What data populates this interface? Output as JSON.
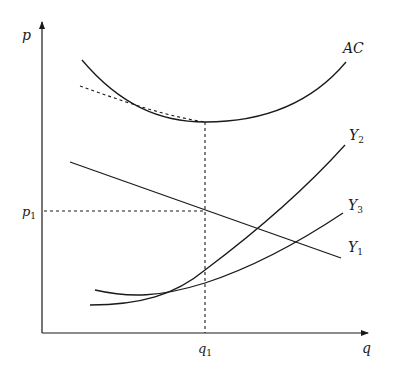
{
  "diagram": {
    "type": "economics-cost-curves",
    "axes": {
      "y_label": "p",
      "x_label": "q"
    },
    "reference_points": {
      "p1": {
        "label": "p",
        "subscript": "1"
      },
      "q1": {
        "label": "q",
        "subscript": "1"
      }
    },
    "curves": [
      {
        "id": "AC",
        "label": "AC",
        "subscript": "",
        "style": "solid",
        "shape": "U-shaped"
      },
      {
        "id": "AC-envelope",
        "label": "",
        "subscript": "",
        "style": "dashed",
        "shape": "tangent approaching AC minimum from left"
      },
      {
        "id": "Y1",
        "label": "Y",
        "subscript": "1",
        "style": "solid",
        "shape": "downward sloping line"
      },
      {
        "id": "Y2",
        "label": "Y",
        "subscript": "2",
        "style": "solid",
        "shape": "convex upward, steeper"
      },
      {
        "id": "Y3",
        "label": "Y",
        "subscript": "3",
        "style": "solid",
        "shape": "convex upward, flatter"
      }
    ],
    "colors": {
      "ink": "#1a1a1a",
      "background": "#ffffff"
    }
  }
}
